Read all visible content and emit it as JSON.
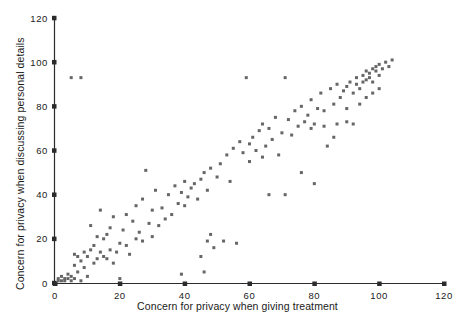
{
  "chart_data": {
    "type": "scatter",
    "title": "",
    "xlabel": "Concern for privacy when giving treatment",
    "ylabel": "Concern for privacy when discussing personal details",
    "xlim": [
      0,
      120
    ],
    "ylim": [
      0,
      120
    ],
    "xticks": [
      0,
      20,
      40,
      60,
      80,
      100,
      120
    ],
    "yticks": [
      0,
      20,
      40,
      60,
      80,
      100,
      120
    ],
    "xticklabels": [
      "0",
      "20",
      "40",
      "60",
      "80",
      "100",
      "120"
    ],
    "yticklabels": [
      "0",
      "20",
      "40",
      "60",
      "80",
      "100",
      "120"
    ],
    "grid": false,
    "legend": null,
    "marker": {
      "shape": "square",
      "size_px": 3,
      "color": "#666666"
    },
    "axis_color": "#2b2b2b",
    "background_color": "#ffffff",
    "points": [
      [
        1,
        1
      ],
      [
        1,
        2
      ],
      [
        2,
        1
      ],
      [
        2,
        3
      ],
      [
        3,
        1
      ],
      [
        3,
        2
      ],
      [
        4,
        2
      ],
      [
        4,
        4
      ],
      [
        5,
        1
      ],
      [
        5,
        3
      ],
      [
        5,
        93
      ],
      [
        6,
        2
      ],
      [
        6,
        8
      ],
      [
        6,
        13
      ],
      [
        7,
        5
      ],
      [
        7,
        12
      ],
      [
        8,
        93
      ],
      [
        8,
        1
      ],
      [
        8,
        10
      ],
      [
        9,
        7
      ],
      [
        9,
        14
      ],
      [
        10,
        3
      ],
      [
        10,
        12
      ],
      [
        11,
        26
      ],
      [
        11,
        15
      ],
      [
        12,
        9
      ],
      [
        12,
        17
      ],
      [
        13,
        11
      ],
      [
        13,
        21
      ],
      [
        14,
        14
      ],
      [
        14,
        33
      ],
      [
        15,
        12
      ],
      [
        15,
        20
      ],
      [
        16,
        22
      ],
      [
        16,
        11
      ],
      [
        17,
        15
      ],
      [
        17,
        25
      ],
      [
        18,
        9
      ],
      [
        18,
        30
      ],
      [
        19,
        14
      ],
      [
        20,
        2
      ],
      [
        20,
        18
      ],
      [
        21,
        24
      ],
      [
        22,
        17
      ],
      [
        22,
        31
      ],
      [
        23,
        13
      ],
      [
        24,
        28
      ],
      [
        25,
        20
      ],
      [
        25,
        35
      ],
      [
        26,
        23
      ],
      [
        27,
        38
      ],
      [
        27,
        19
      ],
      [
        28,
        51
      ],
      [
        29,
        27
      ],
      [
        30,
        21
      ],
      [
        30,
        33
      ],
      [
        31,
        42
      ],
      [
        32,
        26
      ],
      [
        33,
        34
      ],
      [
        34,
        29
      ],
      [
        35,
        40
      ],
      [
        36,
        31
      ],
      [
        37,
        44
      ],
      [
        38,
        36
      ],
      [
        39,
        4
      ],
      [
        39,
        41
      ],
      [
        40,
        35
      ],
      [
        40,
        46
      ],
      [
        41,
        39
      ],
      [
        42,
        43
      ],
      [
        43,
        45
      ],
      [
        44,
        38
      ],
      [
        45,
        47
      ],
      [
        45,
        12
      ],
      [
        46,
        50
      ],
      [
        46,
        5
      ],
      [
        47,
        42
      ],
      [
        47,
        19
      ],
      [
        48,
        22
      ],
      [
        48,
        52
      ],
      [
        49,
        16
      ],
      [
        50,
        48
      ],
      [
        51,
        54
      ],
      [
        52,
        19
      ],
      [
        53,
        58
      ],
      [
        54,
        46
      ],
      [
        55,
        61
      ],
      [
        56,
        18
      ],
      [
        57,
        64
      ],
      [
        58,
        59
      ],
      [
        59,
        93
      ],
      [
        60,
        63
      ],
      [
        60,
        55
      ],
      [
        61,
        66
      ],
      [
        62,
        60
      ],
      [
        63,
        69
      ],
      [
        64,
        57
      ],
      [
        64,
        72
      ],
      [
        65,
        62
      ],
      [
        66,
        70
      ],
      [
        66,
        40
      ],
      [
        67,
        65
      ],
      [
        68,
        75
      ],
      [
        69,
        58
      ],
      [
        70,
        68
      ],
      [
        71,
        93
      ],
      [
        71,
        40
      ],
      [
        72,
        74
      ],
      [
        73,
        67
      ],
      [
        74,
        78
      ],
      [
        75,
        71
      ],
      [
        76,
        50
      ],
      [
        76,
        80
      ],
      [
        77,
        73
      ],
      [
        78,
        76
      ],
      [
        79,
        83
      ],
      [
        80,
        72
      ],
      [
        80,
        45
      ],
      [
        81,
        79
      ],
      [
        82,
        86
      ],
      [
        83,
        78
      ],
      [
        84,
        62
      ],
      [
        85,
        88
      ],
      [
        86,
        81
      ],
      [
        87,
        72
      ],
      [
        87,
        90
      ],
      [
        88,
        84
      ],
      [
        89,
        87
      ],
      [
        90,
        89
      ],
      [
        90,
        79
      ],
      [
        91,
        91
      ],
      [
        92,
        86
      ],
      [
        92,
        72
      ],
      [
        93,
        93
      ],
      [
        93,
        90
      ],
      [
        94,
        88
      ],
      [
        95,
        94
      ],
      [
        95,
        91
      ],
      [
        96,
        92
      ],
      [
        96,
        96
      ],
      [
        97,
        95
      ],
      [
        97,
        93
      ],
      [
        98,
        97
      ],
      [
        98,
        91
      ],
      [
        99,
        96
      ],
      [
        99,
        98
      ],
      [
        100,
        99
      ],
      [
        100,
        94
      ],
      [
        101,
        97
      ],
      [
        102,
        100
      ],
      [
        103,
        98
      ],
      [
        104,
        101
      ],
      [
        100,
        88
      ],
      [
        98,
        86
      ],
      [
        96,
        84
      ],
      [
        94,
        81
      ],
      [
        90,
        73
      ],
      [
        86,
        66
      ],
      [
        83,
        71
      ],
      [
        79,
        70
      ]
    ]
  }
}
